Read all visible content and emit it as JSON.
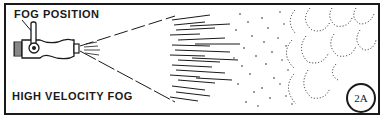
{
  "figure": {
    "label_top": "FOG POSITION",
    "label_bottom": "HIGH VELOCITY FOG",
    "badge": "2A",
    "colors": {
      "ink": "#1a1a1a",
      "paper": "#ffffff"
    },
    "parts": [
      {
        "name": "nozzle",
        "description": "fog nozzle with handle lever set to fog position"
      },
      {
        "name": "spray-cone",
        "description": "fan-shaped spray of streaks and droplets"
      },
      {
        "name": "fog-cloud",
        "description": "dotted scalloped fog droplet cloud"
      }
    ]
  }
}
